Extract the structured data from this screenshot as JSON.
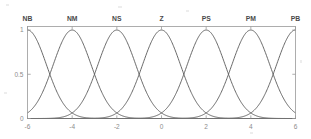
{
  "chart_data": {
    "type": "line",
    "title": "",
    "subtitle": "",
    "xlabel": "",
    "ylabel": "",
    "xlim": [
      -6,
      6
    ],
    "ylim": [
      0,
      1.04
    ],
    "xticks": [
      -6,
      -4,
      -2,
      0,
      2,
      4,
      6
    ],
    "xticklabels": [
      "-6",
      "-4",
      "-2",
      "0",
      "2",
      "4",
      "6"
    ],
    "yticks": [
      0,
      0.5,
      1
    ],
    "yticklabels": [
      "0",
      "0.5",
      "1"
    ],
    "grid": false,
    "legend_position": "none",
    "annotations": [
      {
        "text": "NB",
        "x": -6,
        "y": 1.12
      },
      {
        "text": "NM",
        "x": -4,
        "y": 1.12
      },
      {
        "text": "NS",
        "x": -2,
        "y": 1.12
      },
      {
        "text": "Z",
        "x": 0,
        "y": 1.12
      },
      {
        "text": "PS",
        "x": 2,
        "y": 1.12
      },
      {
        "text": "PM",
        "x": 4,
        "y": 1.12
      },
      {
        "text": "PB",
        "x": 6,
        "y": 1.12
      }
    ],
    "series": [
      {
        "name": "NB",
        "shape": "gaussian",
        "center": -6,
        "sigma": 0.85,
        "peak": 1
      },
      {
        "name": "NM",
        "shape": "gaussian",
        "center": -4,
        "sigma": 0.85,
        "peak": 1
      },
      {
        "name": "NS",
        "shape": "gaussian",
        "center": -2,
        "sigma": 0.85,
        "peak": 1
      },
      {
        "name": "Z",
        "shape": "gaussian",
        "center": 0,
        "sigma": 0.85,
        "peak": 1
      },
      {
        "name": "PS",
        "shape": "gaussian",
        "center": 2,
        "sigma": 0.85,
        "peak": 1
      },
      {
        "name": "PM",
        "shape": "gaussian",
        "center": 4,
        "sigma": 0.85,
        "peak": 1
      },
      {
        "name": "PB",
        "shape": "gaussian",
        "center": 6,
        "sigma": 0.85,
        "peak": 1
      }
    ],
    "colors": {
      "curve": "#585858",
      "axis": "#9a9a9a",
      "tick_label": "#8c8c8c",
      "set_label": "#4a4a4a",
      "background": "#ffffff"
    }
  },
  "figure": {
    "name": "fuzzy-membership-function-plot"
  }
}
